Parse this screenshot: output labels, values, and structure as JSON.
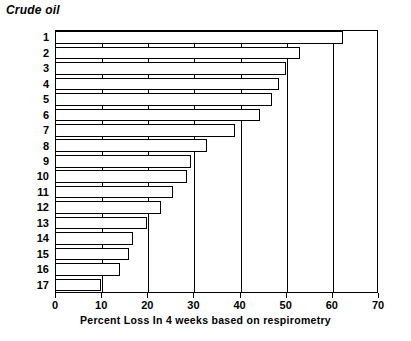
{
  "chart_data": {
    "type": "bar",
    "orientation": "horizontal",
    "title": "Crude oil",
    "xlabel": "Percent Loss In 4 weeks based on respirometry",
    "ylabel": "",
    "categories": [
      "1",
      "2",
      "3",
      "4",
      "5",
      "6",
      "7",
      "8",
      "9",
      "10",
      "11",
      "12",
      "13",
      "14",
      "15",
      "16",
      "17"
    ],
    "values": [
      62.5,
      53,
      50,
      48.5,
      47,
      44.5,
      39,
      33,
      29.5,
      28.5,
      25.5,
      23,
      20,
      17,
      16,
      14,
      10
    ],
    "xlim": [
      0,
      70
    ],
    "xticks": [
      0,
      10,
      20,
      30,
      40,
      50,
      60,
      70
    ],
    "xticklabels": [
      "0",
      "10",
      "20",
      "30",
      "40",
      "50",
      "60",
      "70"
    ],
    "grid": true,
    "gridlines": [
      10,
      20,
      30,
      40,
      50,
      60
    ],
    "legend": "none",
    "bar_facecolor": "#ffffff",
    "bar_edgecolor": "#000000",
    "axes_color": "#000000",
    "background": "#ffffff"
  }
}
